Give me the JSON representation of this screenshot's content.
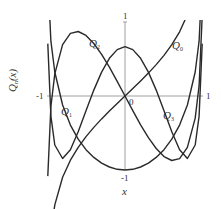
{
  "chart_data": {
    "type": "line",
    "title": "",
    "xlabel": "x",
    "ylabel": "Q_n(x)",
    "xlim": [
      -1,
      1
    ],
    "ylim": [
      -1.2,
      1.35
    ],
    "grid": false,
    "legend_position": "inline labels",
    "axis_ticks": {
      "x_left": "-1",
      "x_right": "1",
      "y_top": "1",
      "y_bottom": "-1",
      "origin": "0"
    },
    "x": [
      -0.99,
      -0.95,
      -0.9,
      -0.8,
      -0.7,
      -0.6,
      -0.5,
      -0.4,
      -0.3,
      -0.2,
      -0.1,
      0,
      0.1,
      0.2,
      0.3,
      0.4,
      0.5,
      0.6,
      0.7,
      0.8,
      0.9,
      0.95,
      0.99
    ],
    "series": [
      {
        "name": "Q0",
        "label_main": "Q",
        "label_sub": "0",
        "values": [
          -2.647,
          -1.832,
          -1.472,
          -1.099,
          -0.867,
          -0.693,
          -0.549,
          -0.424,
          -0.31,
          -0.203,
          -0.1,
          0,
          0.1,
          0.203,
          0.31,
          0.424,
          0.549,
          0.693,
          0.867,
          1.099,
          1.472,
          1.832,
          2.647
        ]
      },
      {
        "name": "Q1",
        "label_main": "Q",
        "label_sub": "1",
        "values": [
          1.621,
          0.74,
          0.325,
          -0.121,
          -0.393,
          -0.584,
          -0.725,
          -0.83,
          -0.907,
          -0.959,
          -0.99,
          -1.0,
          -0.99,
          -0.959,
          -0.907,
          -0.83,
          -0.725,
          -0.584,
          -0.393,
          -0.121,
          0.325,
          0.74,
          1.621
        ]
      },
      {
        "name": "Q2",
        "label_main": "Q",
        "label_sub": "2",
        "values": [
          -1.083,
          -0.139,
          0.298,
          0.695,
          0.846,
          0.872,
          0.819,
          0.71,
          0.563,
          0.389,
          0.199,
          0,
          -0.199,
          -0.389,
          -0.563,
          -0.71,
          -0.819,
          -0.872,
          -0.846,
          -0.695,
          -0.298,
          0.139,
          1.083
        ]
      },
      {
        "name": "Q3",
        "label_main": "Q",
        "label_sub": "3",
        "values": [
          0.708,
          -0.272,
          -0.662,
          -0.845,
          -0.725,
          -0.483,
          -0.198,
          0.08,
          0.323,
          0.51,
          0.627,
          0.667,
          0.627,
          0.51,
          0.323,
          0.08,
          -0.198,
          -0.483,
          -0.725,
          -0.845,
          -0.662,
          -0.272,
          0.708
        ]
      }
    ],
    "annotations": [
      {
        "text": "Q0",
        "x": 0.62,
        "y": 0.85
      },
      {
        "text": "Q1",
        "x": -0.85,
        "y": -0.25
      },
      {
        "text": "Q2",
        "x": -0.22,
        "y": 1.12
      },
      {
        "text": "Q3",
        "x": 0.55,
        "y": -0.62
      }
    ],
    "style": {
      "line_color": "#2a2a2a",
      "axis_color": "#888888"
    }
  }
}
